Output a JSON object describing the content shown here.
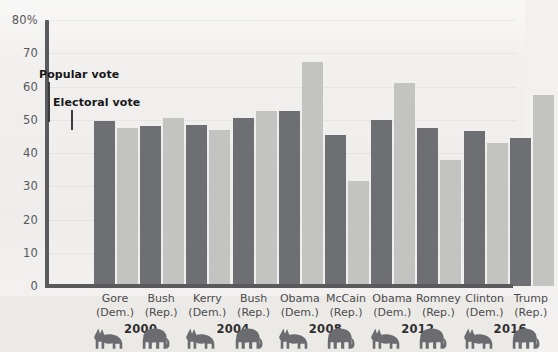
{
  "chart_data": {
    "type": "bar",
    "title": "",
    "xlabel": "",
    "ylabel": "",
    "ylim": [
      0,
      80
    ],
    "yticks": [
      0,
      10,
      20,
      30,
      40,
      50,
      60,
      70,
      80
    ],
    "ytick_labels": [
      "0",
      "10",
      "20",
      "30",
      "40",
      "50",
      "60",
      "70",
      "80%"
    ],
    "grid": true,
    "legend_position": "inside-top-left",
    "categories": [
      "Gore (Dem.)",
      "Bush (Rep.)",
      "Kerry (Dem.)",
      "Bush (Rep.)",
      "Obama (Dem.)",
      "McCain (Rep.)",
      "Obama (Dem.)",
      "Romney (Rep.)",
      "Clinton (Dem.)",
      "Trump (Rep.)"
    ],
    "series": [
      {
        "name": "Popular vote",
        "color": "#6e6f73",
        "values": [
          49.5,
          48.0,
          48.5,
          50.5,
          52.5,
          45.5,
          50.0,
          47.5,
          46.5,
          44.5
        ]
      },
      {
        "name": "Electoral vote",
        "color": "#c3c3c1",
        "values": [
          47.5,
          50.5,
          47.0,
          52.5,
          67.5,
          31.5,
          61.0,
          38.0,
          43.0,
          57.5
        ]
      }
    ],
    "annotations": [
      {
        "text": "Popular vote",
        "target_series": "Popular vote",
        "target_category": "Gore (Dem.)"
      },
      {
        "text": "Electoral vote",
        "target_series": "Electoral vote",
        "target_category": "Gore (Dem.)"
      }
    ]
  },
  "axis": {
    "ytick_labels": [
      "80%",
      "70",
      "60",
      "50",
      "40",
      "30",
      "20",
      "10",
      "0"
    ]
  },
  "candidates": [
    {
      "name": "Gore",
      "party": "(Dem.)",
      "icon": "donkey-icon",
      "popular": 49.5,
      "electoral": 47.5
    },
    {
      "name": "Bush",
      "party": "(Rep.)",
      "icon": "elephant-icon",
      "popular": 48.0,
      "electoral": 50.5
    },
    {
      "name": "Kerry",
      "party": "(Dem.)",
      "icon": "donkey-icon",
      "popular": 48.5,
      "electoral": 47.0
    },
    {
      "name": "Bush",
      "party": "(Rep.)",
      "icon": "elephant-icon",
      "popular": 50.5,
      "electoral": 52.5
    },
    {
      "name": "Obama",
      "party": "(Dem.)",
      "icon": "donkey-icon",
      "popular": 52.5,
      "electoral": 67.5
    },
    {
      "name": "McCain",
      "party": "(Rep.)",
      "icon": "elephant-icon",
      "popular": 45.5,
      "electoral": 31.5
    },
    {
      "name": "Obama",
      "party": "(Dem.)",
      "icon": "donkey-icon",
      "popular": 50.0,
      "electoral": 61.0
    },
    {
      "name": "Romney",
      "party": "(Rep.)",
      "icon": "elephant-icon",
      "popular": 47.5,
      "electoral": 38.0
    },
    {
      "name": "Clinton",
      "party": "(Dem.)",
      "icon": "donkey-icon",
      "popular": 46.5,
      "electoral": 43.0
    },
    {
      "name": "Trump",
      "party": "(Rep.)",
      "icon": "elephant-icon",
      "popular": 44.5,
      "electoral": 57.5
    }
  ],
  "years": [
    "2000",
    "2004",
    "2008",
    "2012",
    "2016"
  ],
  "legend": {
    "popular_label": "Popular vote",
    "electoral_label": "Electoral vote"
  },
  "colors": {
    "popular_bar": "#6e6f73",
    "electoral_bar": "#c3c3c1",
    "axis": "#5a5a5c",
    "background": "#f1f0ee",
    "bottom_band": "#eceae7",
    "text": "#4b4b4d"
  }
}
